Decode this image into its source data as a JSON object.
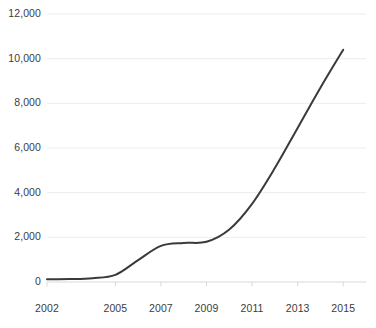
{
  "chart_data": {
    "type": "line",
    "title": "",
    "subtitle": "",
    "xlabel": "",
    "ylabel": "",
    "grid": true,
    "legend": false,
    "legend_position": "none",
    "line_color": "#3a3a3a",
    "line_width": 2,
    "background_color": "#ffffff",
    "gridline_color": "#ededed",
    "axis_color": "#d9d9d9",
    "tick_label_color": "#3c3c3c",
    "xlim": [
      2002,
      2016
    ],
    "ylim": [
      0,
      12000
    ],
    "yticks": [
      0,
      2000,
      4000,
      6000,
      8000,
      10000,
      12000
    ],
    "ytick_labels": [
      "0",
      "2,000",
      "4,000",
      "6,000",
      "8,000",
      "10,000",
      "12,000"
    ],
    "xticks": [
      2002,
      2005,
      2007,
      2009,
      2011,
      2013,
      2015
    ],
    "xtick_labels": [
      "2002",
      "2005",
      "2007",
      "2009",
      "2011",
      "2013",
      "2015"
    ],
    "x": [
      2002,
      2003,
      2004,
      2005,
      2006,
      2007,
      2008,
      2009,
      2010,
      2011,
      2012,
      2013,
      2014,
      2015
    ],
    "values": [
      120,
      130,
      170,
      320,
      980,
      1620,
      1750,
      1800,
      2350,
      3500,
      5100,
      6900,
      8700,
      10400
    ]
  }
}
